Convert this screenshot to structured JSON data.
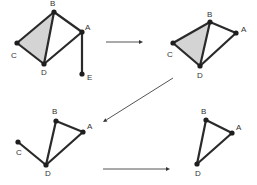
{
  "diagram": {
    "colors": {
      "edge": "#2a2a2a",
      "shade": "#d4d4d4",
      "arrow": "#555555"
    },
    "panels": [
      {
        "id": "panel-1",
        "nodes": [
          {
            "label": "B",
            "x": 54,
            "y": 12,
            "lx": 50,
            "ly": 6
          },
          {
            "label": "A",
            "x": 82,
            "y": 32,
            "lx": 85,
            "ly": 30
          },
          {
            "label": "C",
            "x": 17,
            "y": 43,
            "lx": 11,
            "ly": 58
          },
          {
            "label": "D",
            "x": 44,
            "y": 64,
            "lx": 41,
            "ly": 75
          },
          {
            "label": "E",
            "x": 82,
            "y": 74,
            "lx": 87,
            "ly": 80
          }
        ],
        "edges": [
          [
            "B",
            "A"
          ],
          [
            "B",
            "C"
          ],
          [
            "B",
            "D"
          ],
          [
            "C",
            "D"
          ],
          [
            "D",
            "A"
          ],
          [
            "A",
            "E"
          ]
        ],
        "shaded": [
          "B",
          "C",
          "D"
        ]
      },
      {
        "id": "panel-2",
        "nodes": [
          {
            "label": "B",
            "x": 210,
            "y": 22,
            "lx": 207,
            "ly": 17
          },
          {
            "label": "A",
            "x": 236,
            "y": 33,
            "lx": 241,
            "ly": 32
          },
          {
            "label": "C",
            "x": 173,
            "y": 43,
            "lx": 167,
            "ly": 57
          },
          {
            "label": "D",
            "x": 200,
            "y": 66,
            "lx": 197,
            "ly": 78
          }
        ],
        "edges": [
          [
            "B",
            "A"
          ],
          [
            "B",
            "C"
          ],
          [
            "B",
            "D"
          ],
          [
            "C",
            "D"
          ],
          [
            "D",
            "A"
          ]
        ],
        "shaded": [
          "B",
          "C",
          "D"
        ]
      },
      {
        "id": "panel-3",
        "nodes": [
          {
            "label": "B",
            "x": 56,
            "y": 121,
            "lx": 52,
            "ly": 114
          },
          {
            "label": "A",
            "x": 83,
            "y": 132,
            "lx": 87,
            "ly": 129
          },
          {
            "label": "C",
            "x": 18,
            "y": 142,
            "lx": 16,
            "ly": 155
          },
          {
            "label": "D",
            "x": 46,
            "y": 165,
            "lx": 45,
            "ly": 176
          }
        ],
        "edges": [
          [
            "B",
            "A"
          ],
          [
            "B",
            "D"
          ],
          [
            "C",
            "D"
          ],
          [
            "D",
            "A"
          ]
        ],
        "shaded": []
      },
      {
        "id": "panel-4",
        "nodes": [
          {
            "label": "B",
            "x": 206,
            "y": 120,
            "lx": 201,
            "ly": 114
          },
          {
            "label": "A",
            "x": 232,
            "y": 133,
            "lx": 236,
            "ly": 130
          },
          {
            "label": "D",
            "x": 197,
            "y": 164,
            "lx": 195,
            "ly": 176
          }
        ],
        "edges": [
          [
            "B",
            "A"
          ],
          [
            "B",
            "D"
          ],
          [
            "D",
            "A"
          ]
        ],
        "shaded": []
      }
    ],
    "arrows": [
      {
        "from": [
          106,
          42
        ],
        "to": [
          143,
          42
        ]
      },
      {
        "from": [
          173,
          78
        ],
        "to": [
          103,
          122
        ]
      },
      {
        "from": [
          103,
          169
        ],
        "to": [
          170,
          169
        ]
      }
    ]
  }
}
